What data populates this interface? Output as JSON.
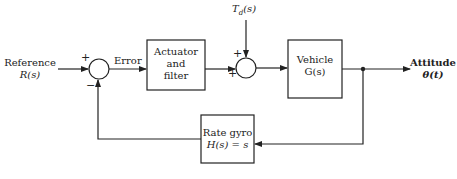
{
  "diagram": {
    "type": "feedback-control-block-diagram",
    "input": {
      "line1": "Reference",
      "line2": "R(s)"
    },
    "error_label": "Error",
    "disturbance_label": "T_d(s)",
    "disturbance_main": "T",
    "disturbance_sub": "d",
    "disturbance_arg": "(s)",
    "output": {
      "line1": "Attitude",
      "line2": "θ(t)"
    },
    "junction1": {
      "sign_top": "+",
      "sign_bottom": "−"
    },
    "junction2": {
      "sign_top": "+",
      "sign_left": "+"
    },
    "blocks": {
      "actuator": {
        "line1": "Actuator",
        "line2": "and",
        "line3": "filter"
      },
      "vehicle": {
        "line1": "Vehicle",
        "line2": "G(s)"
      },
      "rate_gyro": {
        "line1": "Rate gyro",
        "line2": "H(s) = s"
      }
    },
    "colors": {
      "line": "#222222",
      "background": "#ffffff"
    }
  }
}
